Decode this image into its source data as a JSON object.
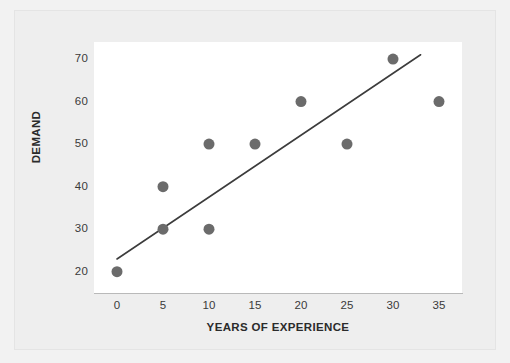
{
  "chart_data": {
    "type": "scatter",
    "title": "",
    "xlabel": "YEARS OF EXPERIENCE",
    "ylabel": "DEMAND",
    "xlim": [
      -2.5,
      37.5
    ],
    "ylim": [
      15,
      74
    ],
    "xticks": [
      0,
      5,
      10,
      15,
      20,
      25,
      30,
      35
    ],
    "yticks": [
      20,
      30,
      40,
      50,
      60,
      70
    ],
    "xtick_labels": [
      "0",
      "5",
      "10",
      "15",
      "20",
      "25",
      "30",
      "35"
    ],
    "ytick_labels": [
      "20",
      "30",
      "40",
      "50",
      "60",
      "70"
    ],
    "grid": false,
    "legend": "none",
    "points": [
      {
        "x": 0,
        "y": 20
      },
      {
        "x": 5,
        "y": 30
      },
      {
        "x": 5,
        "y": 40
      },
      {
        "x": 10,
        "y": 30
      },
      {
        "x": 10,
        "y": 50
      },
      {
        "x": 15,
        "y": 50
      },
      {
        "x": 20,
        "y": 60
      },
      {
        "x": 25,
        "y": 50
      },
      {
        "x": 30,
        "y": 70
      },
      {
        "x": 35,
        "y": 60
      }
    ],
    "series": [
      {
        "name": "Demand observations",
        "type": "scatter",
        "x": [
          0,
          5,
          5,
          10,
          10,
          15,
          20,
          25,
          30,
          35
        ],
        "values": [
          20,
          30,
          40,
          30,
          50,
          50,
          60,
          50,
          70,
          60
        ],
        "marker": "circle",
        "marker_size": 9,
        "color": "#6b6b6b"
      },
      {
        "name": "Trend line",
        "type": "line",
        "x": [
          0,
          33
        ],
        "values": [
          23,
          71
        ],
        "color": "#3c3c3c",
        "line_width": 1.6
      }
    ],
    "trendline": {
      "x_start": 0,
      "y_start": 23,
      "x_end": 33,
      "y_end": 71,
      "slope": 1.4545,
      "intercept": 23
    },
    "colors": {
      "marker": "#6b6b6b",
      "line": "#3c3c3c",
      "plot_background": "#ffffff",
      "figure_background": "#eeeeee",
      "page_background": "#f2f2f2",
      "axis": "#b9b9b9",
      "text": "#2b2b2b"
    }
  }
}
